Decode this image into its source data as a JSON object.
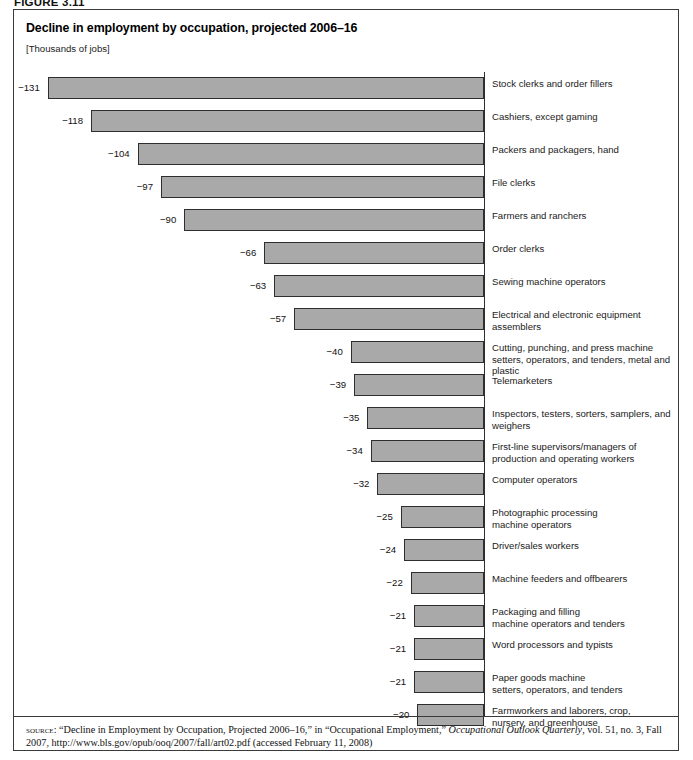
{
  "figure": {
    "number_label": "FIGURE 3.11"
  },
  "chart_data": {
    "type": "bar",
    "orientation": "horizontal",
    "title": "Decline in employment by occupation, projected 2006–16",
    "units_note": "[Thousands of jobs]",
    "xlabel": "",
    "ylabel": "",
    "grid": false,
    "legend": "none",
    "value_axis_range": [
      -131,
      0
    ],
    "value_suffix": " thousand jobs",
    "categories": [
      "Stock clerks and order fillers",
      "Cashiers, except gaming",
      "Packers and packagers, hand",
      "File clerks",
      "Farmers and ranchers",
      "Order clerks",
      "Sewing machine operators",
      "Electrical and electronic equipment assemblers",
      "Cutting, punching, and press machine\nsetters, operators, and tenders, metal and plastic",
      "Telemarketers",
      "Inspectors, testers, sorters, samplers, and weighers",
      "First-line supervisors/managers of\nproduction and operating workers",
      "Computer operators",
      "Photographic processing\nmachine operators",
      "Driver/sales workers",
      "Machine feeders and offbearers",
      "Packaging and filling\nmachine operators and tenders",
      "Word processors and typists",
      "Paper goods machine\nsetters, operators, and tenders",
      "Farmworkers and laborers, crop,\nnursery, and greenhouse"
    ],
    "values": [
      -131,
      -118,
      -104,
      -97,
      -90,
      -66,
      -63,
      -57,
      -40,
      -39,
      -35,
      -34,
      -32,
      -25,
      -24,
      -22,
      -21,
      -21,
      -21,
      -20
    ],
    "value_labels": [
      "−131",
      "−118",
      "−104",
      "−97",
      "−90",
      "−66",
      "−63",
      "−57",
      "−40",
      "−39",
      "−35",
      "−34",
      "−32",
      "−25",
      "−24",
      "−22",
      "−21",
      "−21",
      "−21",
      "−20"
    ],
    "bar_fill_color": "#a9a9a9",
    "bar_border_color": "#2e2e2e"
  },
  "source": {
    "label": "source",
    "text": ": “Decline in Employment by Occupation, Projected 2006–16,” in “Occupational Employment,” ",
    "italic_title": "Occupational Outlook Quarterly",
    "tail": ", vol. 51, no. 3, Fall 2007, http://www.bls.gov/opub/ooq/2007/fall/art02.pdf (accessed February 11, 2008)"
  }
}
